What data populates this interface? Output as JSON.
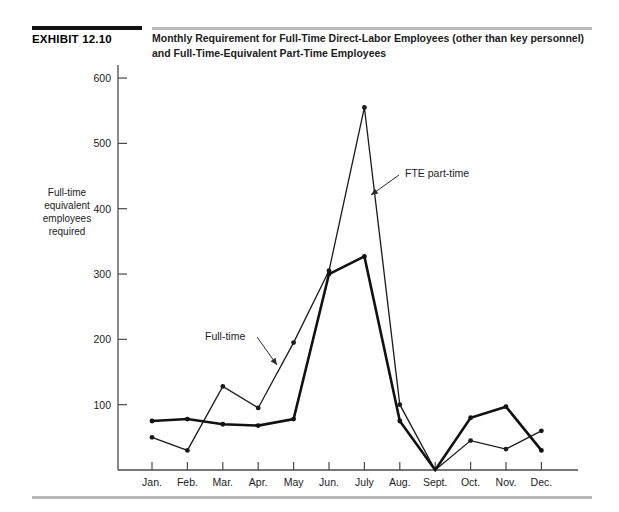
{
  "header": {
    "exhibit_number": "EXHIBIT 12.10",
    "title_line1": "Monthly Requirement for Full-Time Direct-Labor Employees (other than key personnel)",
    "title_line2": "and Full-Time-Equivalent Part-Time Employees"
  },
  "chart_data": {
    "type": "line",
    "title": "Monthly Requirement for Full-Time Direct-Labor Employees (other than key personnel) and Full-Time-Equivalent Part-Time Employees",
    "xlabel": "",
    "ylabel": "Full-time equivalent employees required",
    "ylabel_lines": [
      "Full-time",
      "equivalent",
      "employees",
      "required"
    ],
    "categories": [
      "Jan.",
      "Feb.",
      "Mar.",
      "Apr.",
      "May",
      "Jun.",
      "July",
      "Aug.",
      "Sept.",
      "Oct.",
      "Nov.",
      "Dec."
    ],
    "ylim": [
      0,
      620
    ],
    "yticks": [
      100,
      200,
      300,
      400,
      500,
      600
    ],
    "ytick_labels": [
      "100",
      "200",
      "300",
      "400",
      "500",
      "600"
    ],
    "grid": false,
    "legend_position": "inline-annotations",
    "series": [
      {
        "name": "FTE part-time",
        "style": "thin",
        "color": "#1a1a1a",
        "values": [
          50,
          30,
          128,
          95,
          195,
          305,
          555,
          100,
          0,
          45,
          32,
          60
        ]
      },
      {
        "name": "Full-time",
        "style": "thick",
        "color": "#111111",
        "values": [
          75,
          78,
          70,
          68,
          78,
          300,
          327,
          75,
          0,
          80,
          97,
          30
        ]
      }
    ],
    "annotations": [
      {
        "text": "FTE part-time",
        "target_category": "July",
        "target_value": 330
      },
      {
        "text": "Full-time",
        "target_category": "May",
        "target_value": 150
      }
    ]
  }
}
